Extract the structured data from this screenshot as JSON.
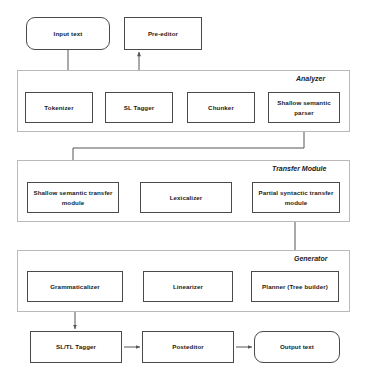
{
  "diagram": {
    "canvas": {
      "width": 368,
      "height": 377
    },
    "colors": {
      "node_border": "#4a4a4a",
      "group_border": "#b9b9b9",
      "edge": "#555555",
      "background": "#ffffff",
      "text": "#1a1a1a"
    },
    "groups": [
      {
        "id": "analyzer",
        "label": "Analyzer",
        "x": 17,
        "y": 70,
        "width": 333,
        "height": 62
      },
      {
        "id": "transfer",
        "label": "Transfer Module",
        "x": 17,
        "y": 160,
        "width": 333,
        "height": 62
      },
      {
        "id": "generator",
        "label": "Generator",
        "x": 17,
        "y": 250,
        "width": 333,
        "height": 62
      }
    ],
    "nodes": [
      {
        "id": "input_text",
        "label": "Input text",
        "shape": "rounded",
        "x": 26,
        "y": 17,
        "width": 84,
        "height": 33
      },
      {
        "id": "pre_editor",
        "label": "Pre-editor",
        "shape": "rect",
        "x": 124,
        "y": 17,
        "width": 78,
        "height": 33
      },
      {
        "id": "tokenizer",
        "label": "Tokenizer",
        "shape": "rect",
        "x": 25,
        "y": 92,
        "width": 68,
        "height": 31
      },
      {
        "id": "sl_tagger",
        "label": "SL Tagger",
        "shape": "rect",
        "x": 105,
        "y": 92,
        "width": 68,
        "height": 31
      },
      {
        "id": "chunker",
        "label": "Chunker",
        "shape": "rect",
        "x": 187,
        "y": 92,
        "width": 68,
        "height": 31
      },
      {
        "id": "shallow_semantic_parser",
        "label": "Shallow semantic parser",
        "shape": "rect",
        "x": 268,
        "y": 92,
        "width": 72,
        "height": 31
      },
      {
        "id": "shallow_semantic_transfer",
        "label": "Shallow semantic transfer module",
        "shape": "rect",
        "x": 27,
        "y": 182,
        "width": 92,
        "height": 31
      },
      {
        "id": "lexicalizer",
        "label": "Lexicalizer",
        "shape": "rect",
        "x": 140,
        "y": 182,
        "width": 92,
        "height": 31
      },
      {
        "id": "partial_syntactic_transfer",
        "label": "Partial syntactic transfer module",
        "shape": "rect",
        "x": 252,
        "y": 182,
        "width": 88,
        "height": 31
      },
      {
        "id": "grammaticalizer",
        "label": "Grammaticalizer",
        "shape": "rect",
        "x": 27,
        "y": 271,
        "width": 96,
        "height": 31
      },
      {
        "id": "linearizer",
        "label": "Linearizer",
        "shape": "rect",
        "x": 143,
        "y": 271,
        "width": 90,
        "height": 31
      },
      {
        "id": "planner",
        "label": "Planner (Tree builder)",
        "shape": "rect",
        "x": 251,
        "y": 271,
        "width": 88,
        "height": 31
      },
      {
        "id": "sl_tl_tagger",
        "label": "SL/TL Tagger",
        "shape": "rect",
        "x": 30,
        "y": 331,
        "width": 92,
        "height": 32
      },
      {
        "id": "posteditor",
        "label": "Posteditor",
        "shape": "rect",
        "x": 142,
        "y": 331,
        "width": 92,
        "height": 32
      },
      {
        "id": "output_text",
        "label": "Output text",
        "shape": "rounded",
        "x": 254,
        "y": 331,
        "width": 86,
        "height": 32
      }
    ],
    "edges": [
      {
        "id": "input-to-tokenizer",
        "from": "input_text",
        "to": "tokenizer",
        "direction": "forward"
      },
      {
        "id": "pre-editor-to-sl-tagger",
        "from": "pre_editor",
        "to": "sl_tagger",
        "direction": "both"
      },
      {
        "id": "tokenizer-to-sl-tagger",
        "from": "tokenizer",
        "to": "sl_tagger",
        "direction": "both"
      },
      {
        "id": "sl-tagger-to-chunker",
        "from": "sl_tagger",
        "to": "chunker",
        "direction": "forward"
      },
      {
        "id": "chunker-to-parser",
        "from": "chunker",
        "to": "shallow_semantic_parser",
        "direction": "forward"
      },
      {
        "id": "parser-to-semantic-transfer",
        "from": "shallow_semantic_parser",
        "to": "shallow_semantic_transfer",
        "direction": "forward"
      },
      {
        "id": "semantic-transfer-to-lexicalizer",
        "from": "shallow_semantic_transfer",
        "to": "lexicalizer",
        "direction": "forward"
      },
      {
        "id": "lexicalizer-to-syntactic-transfer",
        "from": "lexicalizer",
        "to": "partial_syntactic_transfer",
        "direction": "forward"
      },
      {
        "id": "syntactic-transfer-to-planner",
        "from": "partial_syntactic_transfer",
        "to": "planner",
        "direction": "forward"
      },
      {
        "id": "planner-to-linearizer",
        "from": "planner",
        "to": "linearizer",
        "direction": "forward"
      },
      {
        "id": "linearizer-to-grammaticalizer",
        "from": "linearizer",
        "to": "grammaticalizer",
        "direction": "forward"
      },
      {
        "id": "grammaticalizer-to-sl-tl-tagger",
        "from": "grammaticalizer",
        "to": "sl_tl_tagger",
        "direction": "forward"
      },
      {
        "id": "sl-tl-tagger-to-posteditor",
        "from": "sl_tl_tagger",
        "to": "posteditor",
        "direction": "forward"
      },
      {
        "id": "posteditor-to-output",
        "from": "posteditor",
        "to": "output_text",
        "direction": "forward"
      }
    ]
  }
}
